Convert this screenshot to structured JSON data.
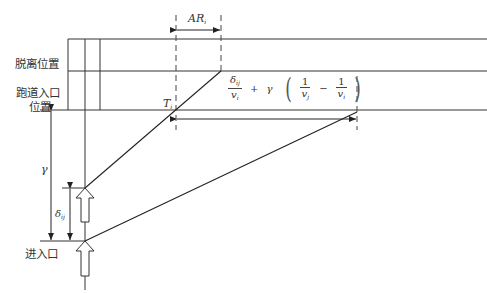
{
  "labels": {
    "departure_position": "脱离位置",
    "runway_entry_line1": "跑道入口",
    "runway_entry_line2": "位置",
    "entrance": "进入口"
  },
  "math": {
    "ar": "AR",
    "ar_sub": "i",
    "t": "T",
    "t_sub": "i",
    "gamma": "γ",
    "delta": "δ",
    "delta_sub": "ij",
    "formula": {
      "frac1_num": "δ",
      "frac1_num_sub": "ij",
      "frac1_den": "v",
      "frac1_den_sub": "i",
      "plus": "+",
      "gamma": "γ",
      "lparen": "(",
      "frac2_num": "1",
      "frac2_den": "v",
      "frac2_den_sub": "j",
      "minus": "−",
      "frac3_num": "1",
      "frac3_den": "v",
      "frac3_den_sub": "i",
      "rparen": ")"
    }
  },
  "colors": {
    "line": "#333333",
    "dash": "#444444",
    "background": "#ffffff"
  }
}
